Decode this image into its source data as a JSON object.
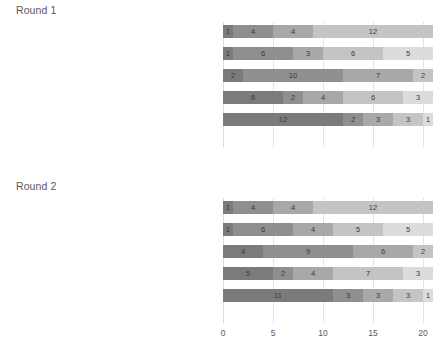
{
  "chart_data": {
    "type": "bar",
    "subtype": "stacked-horizontal",
    "title": "",
    "xlabel": "",
    "ylabel": "",
    "xlim": [
      0,
      21
    ],
    "xticks": [
      0,
      5,
      10,
      15,
      20
    ],
    "grid": true,
    "legend": "none",
    "segment_colors": [
      "#7b7b7b",
      "#8f8f8f",
      "#a8a8a8",
      "#c4c4c4",
      "#dcdcdc"
    ],
    "panels": [
      {
        "title": "Round 1",
        "categories": [
          "S7: “OCHOTA MARKET” – SHOP",
          "S3: “MUSEUM WKD OCHOTA” – INTERACTIVE MUSEUM",
          "S4: “ART OCHOTA” – SMALL ART GALLERY",
          "S1: STATUS QUO – RENOVATION ONLY",
          "S2: “CLUB CAFÉ OCHOTA”"
        ],
        "rows": [
          {
            "label": "S7: “OCHOTA MARKET” – SHOP",
            "values": [
              1,
              4,
              4,
              12
            ],
            "total": 21
          },
          {
            "label": "S3: “MUSEUM WKD OCHOTA” – INTERACTIVE MUSEUM",
            "values": [
              1,
              6,
              3,
              6,
              5
            ],
            "total": 21
          },
          {
            "label": "S4: “ART OCHOTA” – SMALL ART GALLERY",
            "values": [
              2,
              10,
              7,
              2
            ],
            "total": 21
          },
          {
            "label": "S1: STATUS QUO – RENOVATION ONLY",
            "values": [
              6,
              2,
              4,
              6,
              3
            ],
            "total": 21
          },
          {
            "label": "S2: “CLUB CAFÉ OCHOTA”",
            "values": [
              12,
              2,
              3,
              3,
              1
            ],
            "total": 21
          }
        ]
      },
      {
        "title": "Round 2",
        "categories": [
          "S7: “OCHOTA MARKET” – SHOP",
          "S3: “MUSEUM WKD OCHOTA” – INTERACTIVE MUSEUM",
          "S4: “ART OCHOTA” – SMALL ART GALLERY",
          "S1: STATUS QUO – RENOVATION ONLY",
          "S2: “CLUB CAFÉ OCHOTA”"
        ],
        "rows": [
          {
            "label": "S7: “OCHOTA MARKET” – SHOP",
            "values": [
              1,
              4,
              4,
              12
            ],
            "total": 21
          },
          {
            "label": "S3: “MUSEUM WKD OCHOTA” – INTERACTIVE MUSEUM",
            "values": [
              1,
              6,
              4,
              5,
              5
            ],
            "total": 21
          },
          {
            "label": "S4: “ART OCHOTA” – SMALL ART GALLERY",
            "values": [
              4,
              9,
              6,
              2
            ],
            "total": 21
          },
          {
            "label": "S1: STATUS QUO – RENOVATION ONLY",
            "values": [
              5,
              2,
              4,
              7,
              3
            ],
            "total": 21
          },
          {
            "label": "S2: “CLUB CAFÉ OCHOTA”",
            "values": [
              11,
              3,
              3,
              3,
              1
            ],
            "total": 21
          }
        ]
      }
    ]
  }
}
